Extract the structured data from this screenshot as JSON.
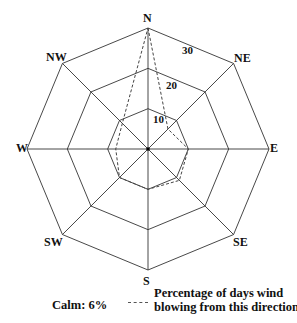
{
  "chart_data": {
    "type": "radar",
    "title": "",
    "categories": [
      "N",
      "NE",
      "E",
      "SE",
      "S",
      "SW",
      "W",
      "NW"
    ],
    "series": [
      {
        "name": "Percentage of days wind blowing from this direction",
        "values": [
          30,
          7,
          10,
          11,
          10,
          10,
          8,
          9
        ]
      }
    ],
    "rings": [
      10,
      20,
      30
    ],
    "ring_labels": [
      "10",
      "20",
      "30"
    ],
    "rmax": 30,
    "annotations": [
      "Calm: 6%"
    ],
    "legend": {
      "line_style": "dashed",
      "text_line1": "Percentage of days wind",
      "text_line2": "blowing from this direction"
    }
  },
  "legend": {
    "calm": "Calm: 6%",
    "line1": "Percentage of days wind",
    "line2": "blowing from this direction"
  },
  "direction_labels": {
    "N": "N",
    "NE": "NE",
    "E": "E",
    "SE": "SE",
    "S": "S",
    "SW": "SW",
    "W": "W",
    "NW": "NW"
  },
  "ring_labels": {
    "r10": "10",
    "r20": "20",
    "r30": "30"
  },
  "colors": {
    "grid": "#333333",
    "data": "#444444",
    "text": "#111111"
  }
}
